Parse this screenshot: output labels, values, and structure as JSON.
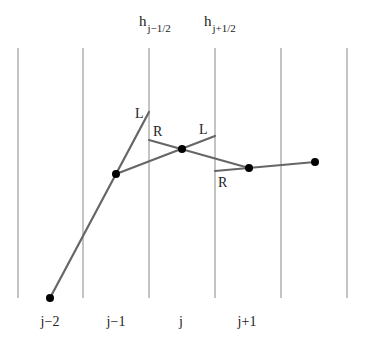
{
  "diagram": {
    "grid_lines_x": [
      18,
      83,
      149,
      215,
      281,
      347
    ],
    "grid_top": 48,
    "grid_bottom": 298,
    "interface_labels": [
      {
        "base": "h",
        "sub": "j−1/2",
        "x": 149
      },
      {
        "base": "h",
        "sub": "j+1/2",
        "x": 215
      }
    ],
    "cell_labels": [
      {
        "text": "j−2",
        "x": 50
      },
      {
        "text": "j−1",
        "x": 116
      },
      {
        "text": "j",
        "x": 182
      },
      {
        "text": "j+1",
        "x": 248
      }
    ],
    "points": [
      {
        "cell": "j-2",
        "x": 50,
        "y": 298
      },
      {
        "cell": "j-1",
        "x": 116,
        "y": 174
      },
      {
        "cell": "j",
        "x": 182,
        "y": 149
      },
      {
        "cell": "j+1",
        "x": 249,
        "y": 168
      },
      {
        "cell": "j+2",
        "x": 315,
        "y": 162
      }
    ],
    "segment_labels": [
      {
        "text": "L",
        "x": 135,
        "y": 118
      },
      {
        "text": "R",
        "x": 153,
        "y": 136
      },
      {
        "text": "L",
        "x": 199,
        "y": 134
      },
      {
        "text": "R",
        "x": 218,
        "y": 187
      }
    ],
    "colors": {
      "line": "#666666",
      "grid": "#888888",
      "point": "#000000"
    }
  }
}
